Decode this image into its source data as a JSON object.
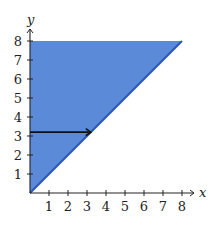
{
  "chart_data": {
    "type": "area",
    "title": "",
    "xlabel": "x",
    "ylabel": "y",
    "xlim": [
      0,
      8
    ],
    "ylim": [
      0,
      8
    ],
    "x_ticks": [
      1,
      2,
      3,
      4,
      5,
      6,
      7,
      8
    ],
    "y_ticks": [
      1,
      2,
      3,
      4,
      5,
      6,
      7,
      8
    ],
    "grid": false,
    "region": {
      "description": "shaded region above line y = x, bounded by x = 0 and y = 8",
      "vertices": [
        [
          0,
          0
        ],
        [
          8,
          8
        ],
        [
          0,
          8
        ]
      ],
      "fill_color": "#5b8ad8",
      "boundary_line": {
        "equation": "y = x",
        "from": [
          0,
          0
        ],
        "to": [
          8,
          8
        ],
        "color": "#2a55b8"
      }
    },
    "annotations": [
      {
        "type": "arrow",
        "from": [
          0,
          3.2
        ],
        "to": [
          3.2,
          3.2
        ],
        "color": "#111111"
      }
    ]
  },
  "axes": {
    "x_label": "x",
    "y_label": "y",
    "x_tick_labels": [
      "1",
      "2",
      "3",
      "4",
      "5",
      "6",
      "7",
      "8"
    ],
    "y_tick_labels": [
      "1",
      "2",
      "3",
      "4",
      "5",
      "6",
      "7",
      "8"
    ]
  },
  "colors": {
    "region_fill": "#5b8ad8",
    "boundary": "#2a55b8",
    "axis": "#222222",
    "arrow": "#111111"
  }
}
